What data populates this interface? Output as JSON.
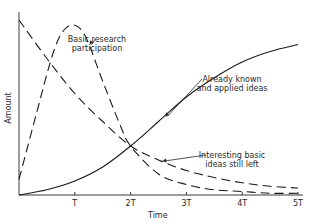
{
  "chart_data": {
    "type": "line",
    "title": "",
    "xlabel": "Time",
    "ylabel": "Amount",
    "xlim": [
      0,
      5
    ],
    "ylim": [
      0,
      1
    ],
    "grid": false,
    "legend": "none (curves labeled directly)",
    "x_ticks": [
      {
        "value": 1,
        "label": "T"
      },
      {
        "value": 2,
        "label": "2T"
      },
      {
        "value": 3,
        "label": "3T"
      },
      {
        "value": 4,
        "label": "4T"
      },
      {
        "value": 5,
        "label": "5T"
      }
    ],
    "series": [
      {
        "name": "Already known and applied ideas",
        "style": "solid",
        "x": [
          0,
          0.5,
          1,
          1.5,
          2,
          2.5,
          3,
          3.5,
          4,
          4.5,
          5
        ],
        "values": [
          0.0,
          0.03,
          0.08,
          0.16,
          0.28,
          0.42,
          0.56,
          0.67,
          0.76,
          0.82,
          0.86
        ],
        "annotation": {
          "text_lines": [
            "Already known",
            "and applied ideas"
          ],
          "anchor_x": 2.6
        }
      },
      {
        "name": "Interesting basic ideas still left",
        "style": "dashed",
        "x": [
          0,
          0.5,
          1,
          1.5,
          2,
          2.5,
          3,
          3.5,
          4,
          4.5,
          5
        ],
        "values": [
          1.0,
          0.78,
          0.58,
          0.42,
          0.28,
          0.2,
          0.14,
          0.1,
          0.07,
          0.05,
          0.04
        ],
        "annotation": {
          "text_lines": [
            "Interesting basic",
            "ideas still left"
          ],
          "anchor_x": 2.55
        }
      },
      {
        "name": "Basic research participation",
        "style": "dashed",
        "x": [
          0,
          0.3,
          0.6,
          0.8,
          1.0,
          1.2,
          1.5,
          1.8,
          2.0,
          2.5,
          3,
          3.5,
          4,
          4.5,
          5
        ],
        "values": [
          0.09,
          0.45,
          0.8,
          0.94,
          0.97,
          0.9,
          0.65,
          0.41,
          0.28,
          0.12,
          0.06,
          0.03,
          0.02,
          0.01,
          0.01
        ],
        "annotation": {
          "text_lines": [
            "Basic research",
            "participation"
          ],
          "anchor_x": 1.25
        }
      }
    ]
  }
}
